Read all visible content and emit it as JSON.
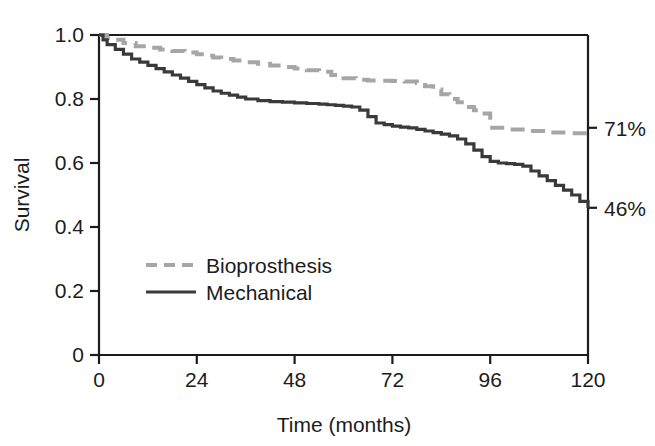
{
  "chart_data": {
    "type": "line",
    "title": "",
    "subtitle": "",
    "xlabel": "Time (months)",
    "ylabel": "Survival",
    "xlim": [
      0,
      120
    ],
    "ylim": [
      0,
      1.0
    ],
    "grid": false,
    "legend_position": "inside-lower-left",
    "x_ticks": [
      "0",
      "24",
      "48",
      "72",
      "96",
      "120"
    ],
    "x_tick_values": [
      0,
      24,
      48,
      72,
      96,
      120
    ],
    "y_ticks": [
      "0",
      "0.2",
      "0.4",
      "0.6",
      "0.8",
      "1.0"
    ],
    "y_tick_values": [
      0,
      0.2,
      0.4,
      0.6,
      0.8,
      1.0
    ],
    "curve_style": "kaplan-meier-step",
    "series": [
      {
        "name": "Bioprosthesis",
        "color": "#a6a6a6",
        "dash": "dashed",
        "endpoint_label": "71%",
        "endpoint_value": 0.71,
        "x": [
          0,
          2,
          4,
          6,
          9,
          12,
          15,
          18,
          21,
          24,
          26,
          28,
          30,
          33,
          36,
          39,
          42,
          45,
          48,
          51,
          54,
          57,
          60,
          63,
          66,
          69,
          72,
          75,
          78,
          80,
          82,
          84,
          86,
          88,
          90,
          92,
          94,
          96,
          100,
          105,
          110,
          115,
          120
        ],
        "y": [
          1.0,
          0.99,
          0.985,
          0.975,
          0.965,
          0.96,
          0.955,
          0.95,
          0.945,
          0.94,
          0.935,
          0.93,
          0.925,
          0.92,
          0.915,
          0.91,
          0.905,
          0.9,
          0.895,
          0.89,
          0.885,
          0.875,
          0.865,
          0.86,
          0.858,
          0.857,
          0.856,
          0.855,
          0.85,
          0.84,
          0.83,
          0.815,
          0.8,
          0.79,
          0.775,
          0.765,
          0.755,
          0.71,
          0.705,
          0.7,
          0.695,
          0.693,
          0.69
        ]
      },
      {
        "name": "Mechanical",
        "color": "#3a3a3a",
        "dash": "solid",
        "endpoint_label": "46%",
        "endpoint_value": 0.46,
        "x": [
          0,
          1,
          2,
          4,
          6,
          8,
          10,
          12,
          14,
          16,
          18,
          20,
          22,
          24,
          26,
          28,
          30,
          32,
          34,
          36,
          39,
          42,
          45,
          48,
          51,
          54,
          56,
          58,
          60,
          62,
          64,
          66,
          68,
          70,
          72,
          74,
          76,
          78,
          80,
          82,
          84,
          86,
          88,
          90,
          92,
          94,
          96,
          98,
          100,
          102,
          104,
          106,
          108,
          110,
          112,
          114,
          116,
          118,
          120
        ],
        "y": [
          1.0,
          0.985,
          0.97,
          0.955,
          0.94,
          0.925,
          0.915,
          0.905,
          0.895,
          0.885,
          0.875,
          0.865,
          0.855,
          0.845,
          0.835,
          0.825,
          0.818,
          0.812,
          0.806,
          0.8,
          0.795,
          0.792,
          0.79,
          0.788,
          0.786,
          0.784,
          0.782,
          0.78,
          0.778,
          0.775,
          0.765,
          0.745,
          0.725,
          0.72,
          0.715,
          0.712,
          0.71,
          0.705,
          0.7,
          0.695,
          0.69,
          0.685,
          0.675,
          0.66,
          0.64,
          0.62,
          0.605,
          0.6,
          0.598,
          0.596,
          0.59,
          0.575,
          0.56,
          0.545,
          0.53,
          0.515,
          0.5,
          0.48,
          0.46
        ]
      }
    ],
    "annotations": [
      {
        "text": "71%",
        "series": "Bioprosthesis",
        "at_x": 120,
        "at_y": 0.71
      },
      {
        "text": "46%",
        "series": "Mechanical",
        "at_x": 120,
        "at_y": 0.46
      }
    ],
    "legend": [
      {
        "label": "Bioprosthesis",
        "color": "#a6a6a6",
        "dash": "dashed"
      },
      {
        "label": "Mechanical",
        "color": "#3a3a3a",
        "dash": "solid"
      }
    ]
  },
  "axis": {
    "frame_color": "#1c1c1c"
  }
}
